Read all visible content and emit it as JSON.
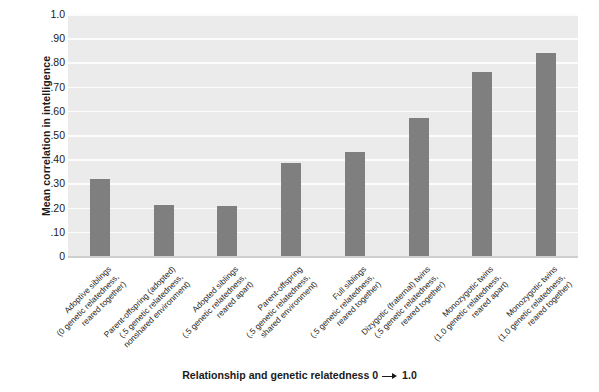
{
  "chart_data": {
    "type": "bar",
    "title": "",
    "xlabel": "Relationship and genetic relatedness 0 — 1.0",
    "ylabel": "Mean correlation in intelligence",
    "ylim": [
      0,
      1.0
    ],
    "grid": true,
    "legend": "none",
    "ytick_labels": [
      "1.0",
      ".90",
      ".80",
      ".70",
      ".60",
      ".50",
      ".40",
      ".30",
      ".20",
      ".10",
      "0"
    ],
    "ytick_values": [
      1.0,
      0.9,
      0.8,
      0.7,
      0.6,
      0.5,
      0.4,
      0.3,
      0.2,
      0.1,
      0.0
    ],
    "categories": [
      "Adoptive siblings\n(0 genetic relatedness,\nreared together)",
      "Parent-offspring (adopted)\n(.5 genetic relatedness,\nnonshared environment)",
      "Adopted siblings\n(.5 genetic relatedness,\nreared apart)",
      "Parent-offspring\n(.5 genetic relatedness,\nshared environment)",
      "Full siblings\n(.5 genetic relatedness,\nreared together)",
      "Dizygotic (fraternal) twins\n(.5 genetic relatedness,\nreared together)",
      "Monozygotic twins\n(1.0 genetic relatedness,\nreared apart)",
      "Monozygotic twins\n(1.0 genetic relatedness,\nreared together)"
    ],
    "category_lines": [
      [
        "Adoptive siblings",
        "(0 genetic relatedness,",
        "reared together)"
      ],
      [
        "Parent-offspring (adopted)",
        "(.5 genetic relatedness,",
        "nonshared environment)"
      ],
      [
        "Adopted siblings",
        "(.5 genetic relatedness,",
        "reared apart)"
      ],
      [
        "Parent-offspring",
        "(.5 genetic relatedness,",
        "shared environment)"
      ],
      [
        "Full siblings",
        "(.5 genetic relatedness,",
        "reared together)"
      ],
      [
        "Dizygotic (fraternal) twins",
        "(.5 genetic relatedness,",
        "reared together)"
      ],
      [
        "Monozygotic twins",
        "(1.0 genetic relatedness,",
        "reared apart)"
      ],
      [
        "Monozygotic twins",
        "(1.0 genetic relatedness,",
        "reared together)"
      ]
    ],
    "values": [
      0.32,
      0.21,
      0.205,
      0.385,
      0.43,
      0.57,
      0.76,
      0.84
    ],
    "bar_color": "#7f7f7f",
    "plot_background": "#ebebeb",
    "gridline_color": "#fcfcfc"
  }
}
